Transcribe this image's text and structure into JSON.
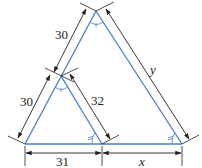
{
  "diagram": {
    "type": "similar-triangles-with-dimensions",
    "colors": {
      "triangle_lines": "#4a7fc1",
      "dimension_lines": "#222222",
      "background": "#ffffff"
    },
    "labels": {
      "upper_left_side": "30",
      "lower_left_side": "30",
      "small_right_side": "32",
      "large_right_side": "y",
      "bottom_left_segment": "31",
      "bottom_right_segment": "x"
    },
    "angle_marks": {
      "apex_large": "single-arc",
      "apex_small": "single-arc",
      "base_small": "double-arc",
      "base_large": "double-arc"
    }
  }
}
